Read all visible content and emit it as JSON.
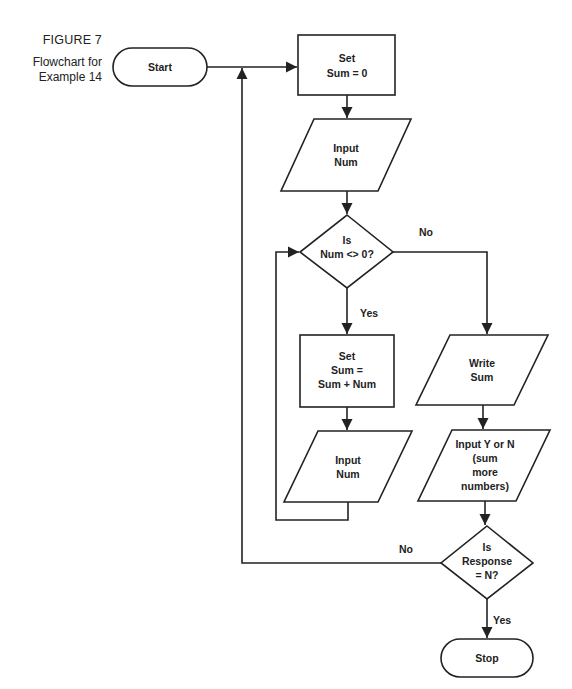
{
  "figure": {
    "label": "FIGURE 7",
    "caption_line1": "Flowchart for",
    "caption_line2": "Example 14"
  },
  "nodes": {
    "start": {
      "type": "terminal",
      "text": "Start"
    },
    "set_sum_zero": {
      "type": "process",
      "line1": "Set",
      "line2": "Sum = 0"
    },
    "input_num_1": {
      "type": "io",
      "line1": "Input",
      "line2": "Num"
    },
    "decision_num": {
      "type": "decision",
      "line1": "Is",
      "line2": "Num <> 0?"
    },
    "set_sum_add": {
      "type": "process",
      "line1": "Set",
      "line2": "Sum =",
      "line3": "Sum + Num"
    },
    "input_num_2": {
      "type": "io",
      "line1": "Input",
      "line2": "Num"
    },
    "write_sum": {
      "type": "io",
      "line1": "Write",
      "line2": "Sum"
    },
    "input_response": {
      "type": "io",
      "line1": "Input  Y or N",
      "line2": "(sum",
      "line3": "more",
      "line4": "numbers)"
    },
    "decision_response": {
      "type": "decision",
      "line1": "Is",
      "line2": "Response",
      "line3": "= N?"
    },
    "stop": {
      "type": "terminal",
      "text": "Stop"
    }
  },
  "edge_labels": {
    "num_no": "No",
    "num_yes": "Yes",
    "response_no": "No",
    "response_yes": "Yes"
  }
}
